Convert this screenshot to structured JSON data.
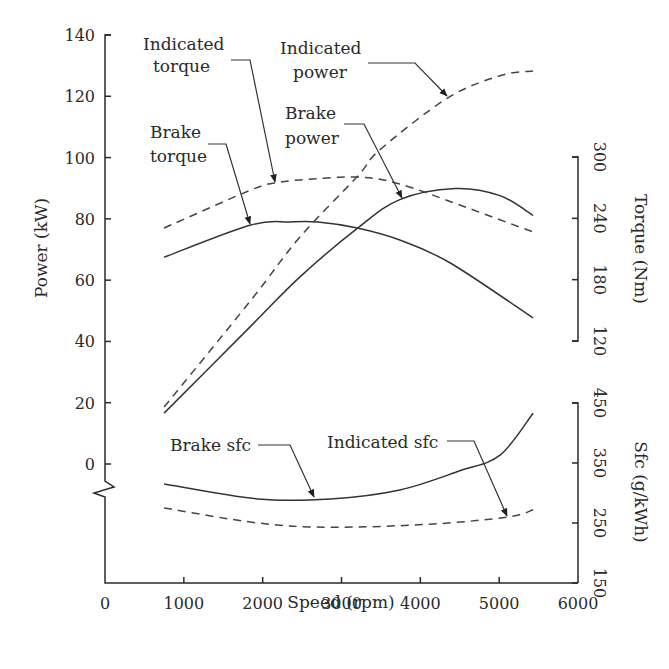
{
  "chart_data": {
    "type": "line",
    "title": "",
    "xlabel": "Speed (rpm)",
    "xlim": [
      0,
      6000
    ],
    "xticks": [
      0,
      1000,
      2000,
      3000,
      4000,
      5000,
      6000
    ],
    "axes": {
      "power": {
        "label": "Power (kW)",
        "side": "left",
        "ticks": [
          0,
          20,
          40,
          60,
          80,
          100,
          120,
          140
        ],
        "ylim": [
          0,
          140
        ],
        "axis_break_below_zero": true
      },
      "torque": {
        "label": "Torque (Nm)",
        "side": "right",
        "ticks": [
          120,
          180,
          240,
          300
        ],
        "ylim": [
          120,
          300
        ]
      },
      "sfc": {
        "label": "Sfc (g/kWh)",
        "side": "right",
        "ticks": [
          150,
          250,
          350,
          450
        ],
        "ylim": [
          150,
          450
        ]
      }
    },
    "grid": false,
    "legend": "none (curves annotated with arrows)",
    "series": [
      {
        "name": "Indicated power",
        "axis": "power",
        "style": "dashed",
        "x": [
          750,
          1850,
          2470,
          3200,
          3490,
          4350,
          5010,
          5430
        ],
        "y": [
          18.6,
          53.4,
          74.0,
          93.8,
          102.6,
          119.5,
          126.7,
          128.3
        ]
      },
      {
        "name": "Brake power",
        "axis": "power",
        "style": "solid",
        "x": [
          750,
          1850,
          2470,
          3200,
          3740,
          4440,
          5010,
          5430
        ],
        "y": [
          16.6,
          45.0,
          61.0,
          76.9,
          86.3,
          89.9,
          87.6,
          81.1
        ]
      },
      {
        "name": "Indicated torque",
        "axis": "torque",
        "style": "dashed",
        "x": [
          750,
          1850,
          2160,
          2470,
          3200,
          3740,
          4500,
          5430
        ],
        "y": [
          230.5,
          267.7,
          274.6,
          277.5,
          280.4,
          273.6,
          253.0,
          226.6
        ]
      },
      {
        "name": "Brake torque",
        "axis": "torque",
        "style": "solid",
        "x": [
          750,
          1850,
          2350,
          2700,
          3200,
          3740,
          4380,
          5430
        ],
        "y": [
          202.0,
          233.5,
          236.4,
          236.4,
          230.5,
          218.8,
          196.3,
          142.5
        ]
      },
      {
        "name": "Brake sfc",
        "axis": "sfc",
        "style": "solid",
        "x": [
          750,
          1940,
          2860,
          3740,
          4500,
          5010,
          5430
        ],
        "y": [
          315,
          290,
          290,
          305,
          337,
          363,
          433
        ]
      },
      {
        "name": "Indicated sfc",
        "axis": "sfc",
        "style": "dashed",
        "x": [
          750,
          1940,
          2860,
          4120,
          5110,
          5430
        ],
        "y": [
          275,
          250,
          243,
          248,
          260,
          272
        ]
      }
    ],
    "annotations": [
      {
        "lines": [
          "Indicated",
          "torque"
        ],
        "target": "Indicated torque"
      },
      {
        "lines": [
          "Indicated",
          "power"
        ],
        "target": "Indicated power"
      },
      {
        "lines": [
          "Brake",
          "torque"
        ],
        "target": "Brake torque"
      },
      {
        "lines": [
          "Brake",
          "power"
        ],
        "target": "Brake power"
      },
      {
        "lines": [
          "Brake sfc"
        ],
        "target": "Brake sfc"
      },
      {
        "lines": [
          "Indicated sfc"
        ],
        "target": "Indicated sfc"
      }
    ]
  }
}
